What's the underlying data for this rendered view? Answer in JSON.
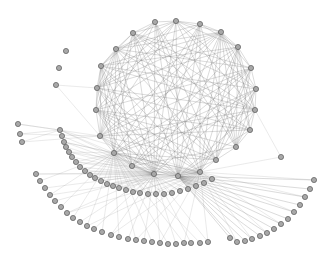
{
  "diagram": {
    "type": "network-graph",
    "node_color": "#a8a8a8",
    "node_stroke": "#5a5a5a",
    "edge_color": "#6a6a6a",
    "background": "#ffffff",
    "node_radius": 2.6,
    "ring": {
      "nodes": [
        [
          97,
          88
        ],
        [
          101,
          66
        ],
        [
          116,
          49
        ],
        [
          133,
          33
        ],
        [
          155,
          22
        ],
        [
          176,
          21
        ],
        [
          200,
          24
        ],
        [
          221,
          32
        ],
        [
          238,
          47
        ],
        [
          251,
          68
        ],
        [
          256,
          89
        ],
        [
          255,
          110
        ],
        [
          250,
          130
        ],
        [
          236,
          147
        ],
        [
          216,
          160
        ],
        [
          200,
          172
        ],
        [
          178,
          176
        ],
        [
          154,
          174
        ],
        [
          132,
          166
        ],
        [
          114,
          153
        ],
        [
          100,
          136
        ],
        [
          96,
          110
        ]
      ],
      "dense_links": true
    },
    "isolated_nodes": [
      [
        66,
        51
      ],
      [
        59,
        68
      ]
    ],
    "branch_nodes": [
      [
        56,
        85
      ]
    ],
    "branch_links": [
      [
        0,
        0
      ],
      [
        0,
        20
      ]
    ],
    "inner_arc": {
      "hub_indices": [
        19,
        17,
        15
      ],
      "nodes": [
        [
          60,
          130
        ],
        [
          62,
          136
        ],
        [
          64,
          142
        ],
        [
          66,
          147
        ],
        [
          69,
          152
        ],
        [
          72,
          157
        ],
        [
          76,
          162
        ],
        [
          80,
          167
        ],
        [
          85,
          171
        ],
        [
          90,
          175
        ],
        [
          95,
          178
        ],
        [
          101,
          181
        ],
        [
          107,
          184
        ],
        [
          113,
          186
        ],
        [
          119,
          188
        ],
        [
          126,
          190
        ],
        [
          133,
          192
        ],
        [
          140,
          193
        ],
        [
          148,
          194
        ],
        [
          156,
          194
        ],
        [
          164,
          194
        ],
        [
          172,
          193
        ],
        [
          180,
          191
        ],
        [
          188,
          189
        ],
        [
          196,
          186
        ],
        [
          204,
          183
        ],
        [
          212,
          179
        ]
      ]
    },
    "left_stub_nodes": [
      [
        18,
        124
      ],
      [
        20,
        134
      ],
      [
        22,
        142
      ]
    ],
    "outer_arc": {
      "hub_indices": [
        17,
        19
      ],
      "nodes": [
        [
          36,
          174
        ],
        [
          40,
          181
        ],
        [
          45,
          188
        ],
        [
          50,
          195
        ],
        [
          55,
          201
        ],
        [
          61,
          207
        ],
        [
          67,
          213
        ],
        [
          73,
          218
        ],
        [
          80,
          222
        ],
        [
          87,
          226
        ],
        [
          94,
          229
        ],
        [
          102,
          232
        ],
        [
          111,
          235
        ],
        [
          119,
          237
        ],
        [
          128,
          239
        ],
        [
          136,
          240
        ],
        [
          144,
          241
        ],
        [
          152,
          242
        ],
        [
          160,
          243
        ],
        [
          168,
          244
        ],
        [
          176,
          244
        ],
        [
          184,
          243
        ],
        [
          191,
          243
        ],
        [
          200,
          243
        ],
        [
          208,
          242
        ]
      ]
    },
    "right_fan": {
      "hub_index": 16,
      "nodes": [
        [
          314,
          180
        ],
        [
          310,
          189
        ],
        [
          305,
          197
        ],
        [
          300,
          205
        ],
        [
          294,
          212
        ],
        [
          288,
          219
        ],
        [
          281,
          224
        ],
        [
          274,
          229
        ],
        [
          267,
          233
        ],
        [
          260,
          236
        ],
        [
          252,
          239
        ],
        [
          245,
          241
        ],
        [
          237,
          242
        ],
        [
          230,
          238
        ]
      ]
    },
    "right_single": [
      [
        281,
        157
      ]
    ]
  }
}
